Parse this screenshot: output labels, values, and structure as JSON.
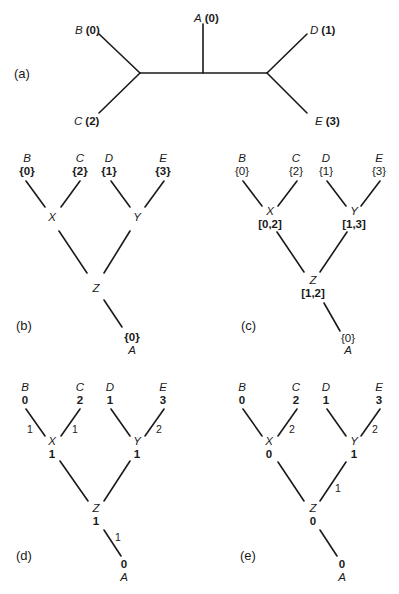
{
  "panels": {
    "a": {
      "label": "(a)",
      "leaves": {
        "A": {
          "name": "A",
          "value": "(0)"
        },
        "B": {
          "name": "B",
          "value": "(0)"
        },
        "C": {
          "name": "C",
          "value": "(2)"
        },
        "D": {
          "name": "D",
          "value": "(1)"
        },
        "E": {
          "name": "E",
          "value": "(3)"
        }
      }
    },
    "b": {
      "label": "(b)",
      "leaves": {
        "B": {
          "name": "B",
          "value": "{0}"
        },
        "C": {
          "name": "C",
          "value": "{2}"
        },
        "D": {
          "name": "D",
          "value": "{1}"
        },
        "E": {
          "name": "E",
          "value": "{3}"
        },
        "A": {
          "name": "A",
          "value": "{0}"
        }
      },
      "internal": {
        "X": {
          "name": "X",
          "value": ""
        },
        "Y": {
          "name": "Y",
          "value": ""
        },
        "Z": {
          "name": "Z",
          "value": ""
        }
      }
    },
    "c": {
      "label": "(c)",
      "leaves": {
        "B": {
          "name": "B",
          "value": "{0}"
        },
        "C": {
          "name": "C",
          "value": "{2}"
        },
        "D": {
          "name": "D",
          "value": "{1}"
        },
        "E": {
          "name": "E",
          "value": "{3}"
        },
        "A": {
          "name": "A",
          "value": "{0}"
        }
      },
      "internal": {
        "X": {
          "name": "X",
          "value": "[0,2]"
        },
        "Y": {
          "name": "Y",
          "value": "[1,3]"
        },
        "Z": {
          "name": "Z",
          "value": "[1,2]"
        }
      }
    },
    "d": {
      "label": "(d)",
      "leaves": {
        "B": {
          "name": "B",
          "value": "0"
        },
        "C": {
          "name": "C",
          "value": "2"
        },
        "D": {
          "name": "D",
          "value": "1"
        },
        "E": {
          "name": "E",
          "value": "3"
        },
        "A": {
          "name": "A",
          "value": "0"
        }
      },
      "internal": {
        "X": {
          "name": "X",
          "value": "1"
        },
        "Y": {
          "name": "Y",
          "value": "1"
        },
        "Z": {
          "name": "Z",
          "value": "1"
        }
      },
      "edges": {
        "BX": "1",
        "CX": "1",
        "EY": "2",
        "ZA": "1"
      }
    },
    "e": {
      "label": "(e)",
      "leaves": {
        "B": {
          "name": "B",
          "value": "0"
        },
        "C": {
          "name": "C",
          "value": "2"
        },
        "D": {
          "name": "D",
          "value": "1"
        },
        "E": {
          "name": "E",
          "value": "3"
        },
        "A": {
          "name": "A",
          "value": "0"
        }
      },
      "internal": {
        "X": {
          "name": "X",
          "value": "0"
        },
        "Y": {
          "name": "Y",
          "value": "1"
        },
        "Z": {
          "name": "Z",
          "value": "0"
        }
      },
      "edges": {
        "CX": "2",
        "EY": "2",
        "YZ": "1"
      }
    }
  }
}
